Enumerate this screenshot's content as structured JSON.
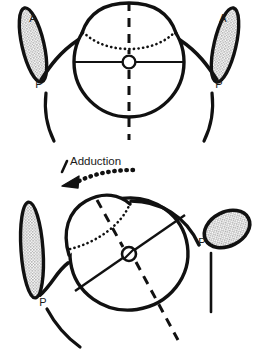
{
  "figure": {
    "background_color": "#ffffff",
    "stroke_color": "#111111",
    "stipple_fill_color": "#b4b4b4",
    "panels": [
      {
        "id": "primary-position",
        "name": "primary-position-panel",
        "labels": {
          "left_anterior": "A",
          "left_posterior": "P",
          "right_anterior": "A",
          "right_posterior": "P"
        }
      },
      {
        "id": "adducted-position",
        "name": "adducted-position-panel",
        "labels": {
          "motion": "Adduction",
          "left_posterior": "P",
          "right_posterior": "P"
        }
      }
    ]
  },
  "annotations": {
    "anterior_abbrev": "A",
    "posterior_abbrev": "P",
    "movement_label": "Adduction"
  }
}
